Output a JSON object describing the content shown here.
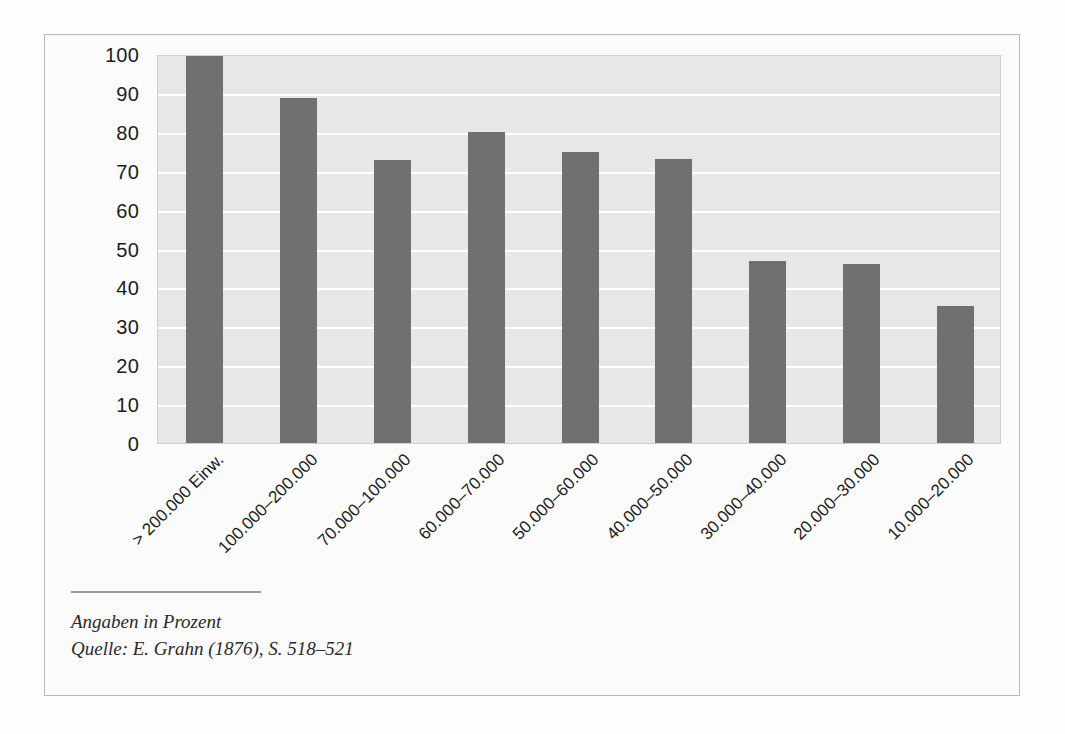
{
  "chart_data": {
    "type": "bar",
    "title": "",
    "subtitle": "",
    "xlabel": "",
    "ylabel": "",
    "ylim": [
      0,
      100
    ],
    "ytick_values": [
      100,
      90,
      80,
      70,
      60,
      50,
      40,
      30,
      20,
      10,
      0
    ],
    "ytick_labels": [
      "100",
      "90",
      "80",
      "70",
      "60",
      "50",
      "40",
      "30",
      "20",
      "10",
      "0"
    ],
    "grid": true,
    "grid_orientation": "horizontal",
    "legend": null,
    "legend_position": "none",
    "categories": [
      "> 200.000 Einw.",
      "100.000–200.000",
      "70.000–100.000",
      "60.000–70.000",
      "50.000–60.000",
      "40.000–50.000",
      "30.000–40.000",
      "20.000–30.000",
      "10.000–20.000"
    ],
    "values": [
      100,
      88.7,
      72.7,
      80,
      74.7,
      73,
      46.7,
      46,
      35.3
    ],
    "units": "Prozent",
    "bar_color": "#6f7072",
    "plot_background": "#e6e7e8",
    "gridline_color": "#ffffff"
  },
  "caption": {
    "line1": "Angaben in Prozent",
    "line2": "Quelle: E. Grahn (1876), S. 518–521"
  }
}
